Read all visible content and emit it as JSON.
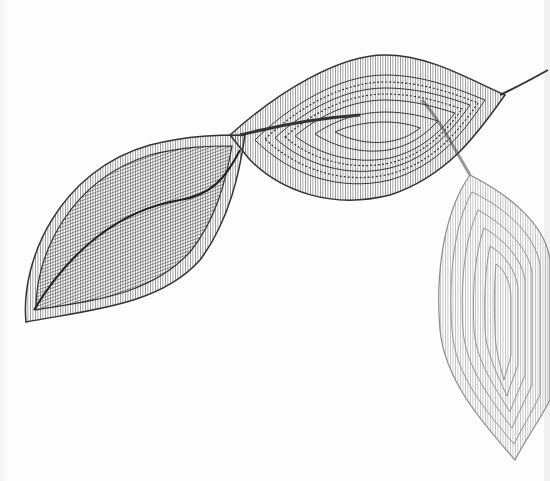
{
  "image": {
    "subject": "line-art illustration of three leaves on a branch",
    "style": "monochrome ink line drawing",
    "background_color": "#fdfdfd",
    "leaves": [
      {
        "name": "left-leaf",
        "color": "#333333",
        "pattern": "radiating hatch lines with striped border"
      },
      {
        "name": "middle-leaf",
        "color": "#3a3a3a",
        "pattern": "concentric almond contours with dotted bands"
      },
      {
        "name": "right-leaf",
        "color": "#8a8a8a",
        "pattern": "concentric contour lines with striped border"
      }
    ],
    "stem_color": "#333333"
  }
}
